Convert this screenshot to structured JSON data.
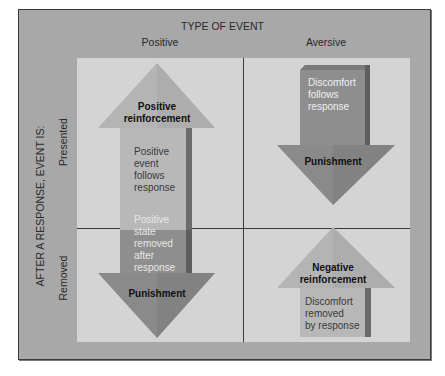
{
  "diagram": {
    "title": "TYPE OF EVENT",
    "columns": [
      "Positive",
      "Aversive"
    ],
    "row_axis_label": "AFTER A RESPONSE, EVENT IS:",
    "rows": [
      "Presented",
      "Removed"
    ],
    "cells": {
      "positive_presented": {
        "arrow_direction": "up",
        "heading": "Positive reinforcement",
        "heading_lines": [
          "Positive",
          "reinforcement"
        ],
        "description_lines": [
          "Positive",
          "event",
          "follows",
          "response"
        ]
      },
      "positive_removed": {
        "arrow_direction": "down",
        "heading": "Punishment",
        "description_lines": [
          "Positive",
          "state",
          "removed",
          "after",
          "response"
        ]
      },
      "aversive_presented": {
        "arrow_direction": "down",
        "heading": "Punishment",
        "description_lines": [
          "Discomfort",
          "follows",
          "response"
        ]
      },
      "aversive_removed": {
        "arrow_direction": "up",
        "heading": "Negative reinforcement",
        "heading_lines": [
          "Negative",
          "reinforcement"
        ],
        "description_lines": [
          "Discomfort",
          "removed",
          "by response"
        ]
      }
    },
    "colors": {
      "frame": "#a8a8a8",
      "grid_background": "#d4d4d4",
      "reinforcement_arrow": "#b4b4b4",
      "punishment_arrow": "#8c8c8c",
      "arrow_shadow": "#6a6a6a",
      "grid_lines": "#3a3a3a"
    }
  }
}
